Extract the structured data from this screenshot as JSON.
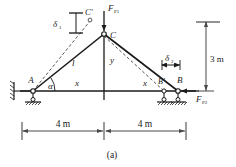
{
  "figure": {
    "caption": "(a)",
    "points": {
      "a": "A",
      "b": "B",
      "b_displaced": "B'",
      "c": "C",
      "c_displaced": "C'"
    },
    "members": {
      "left_length": "l"
    },
    "coordinates": {
      "horizontal_left": "x",
      "horizontal_right": "x",
      "vertical": "y"
    },
    "angles": {
      "alpha": "α"
    },
    "deflections": {
      "delta1": "δ",
      "delta1_sub": "1",
      "delta2": "δ",
      "delta2_sub": "2"
    },
    "forces": {
      "fp1": "F",
      "fp1_sub": "P1",
      "fp2": "F",
      "fp2_sub": "P2"
    },
    "dimensions": {
      "span_left": "4 m",
      "span_right": "4 m",
      "height": "3 m"
    },
    "colors": {
      "line": "#1a1a1a",
      "dim": "#4a4a4a",
      "background": "#ffffff"
    }
  }
}
